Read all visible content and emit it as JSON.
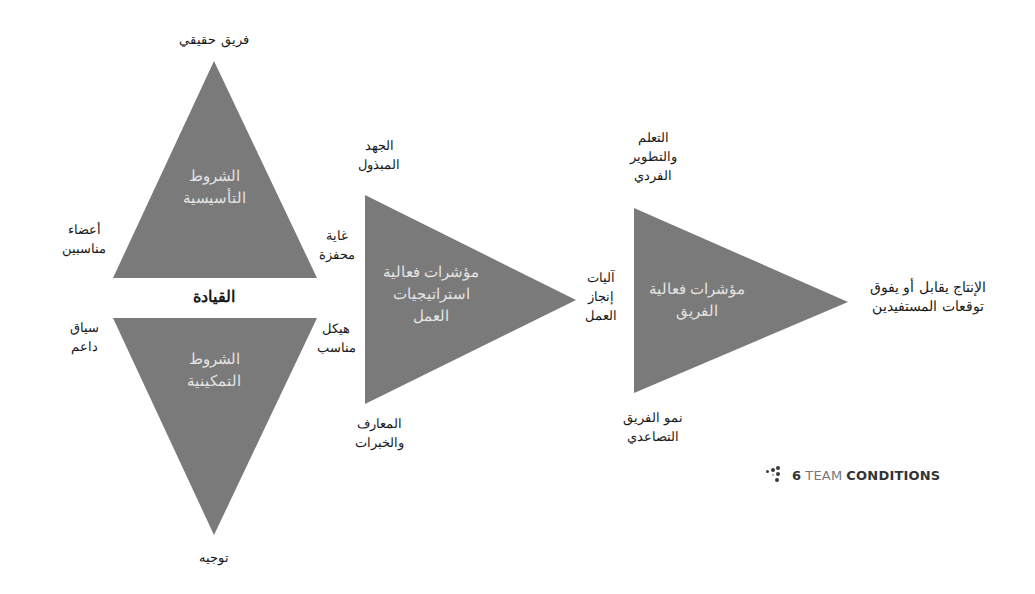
{
  "diagram": {
    "colors": {
      "triangle_fill": "#7a7a7a",
      "inner_text": "#e4e4e4",
      "label_text": "#1a1a1a"
    },
    "foundational_triangle": {
      "inner_line1": "الشروط",
      "inner_line2": "التأسيسية",
      "apex_label": "فريق حقيقي",
      "left_label_line1": "أعضاء",
      "left_label_line2": "مناسبين",
      "right_label_line1": "غاية",
      "right_label_line2": "محفزة"
    },
    "leadership_label": "القيادة",
    "enabling_triangle": {
      "inner_line1": "الشروط",
      "inner_line2": "التمكينية",
      "apex_label": "توجيه",
      "left_label_line1": "سياق",
      "left_label_line2": "داعم",
      "right_label_line1": "هيكل",
      "right_label_line2": "مناسب"
    },
    "work_strategies_triangle": {
      "inner_line1": "مؤشرات فعالية",
      "inner_line2": "استراتيجيات",
      "inner_line3": "العمل",
      "top_label_line1": "الجهد",
      "top_label_line2": "المبذول",
      "bottom_label_line1": "المعارف",
      "bottom_label_line2": "والخبرات",
      "tip_label_line1": "آليات",
      "tip_label_line2": "إنجاز",
      "tip_label_line3": "العمل"
    },
    "team_effectiveness_triangle": {
      "inner_line1": "مؤشرات فعالية",
      "inner_line2": "الفريق",
      "top_label_line1": "التعلم",
      "top_label_line2": "والتطوير",
      "top_label_line3": "الفردي",
      "bottom_label_line1": "نمو الفريق",
      "bottom_label_line2": "التصاعدي"
    },
    "outcome": {
      "line1": "الإنتاج يقابل أو يفوق",
      "line2": "توقعات المستفيدين"
    }
  },
  "brand": {
    "icon": "dots-logo-icon",
    "number": "6",
    "word_light": "TEAM",
    "word_bold": "CONDITIONS"
  }
}
